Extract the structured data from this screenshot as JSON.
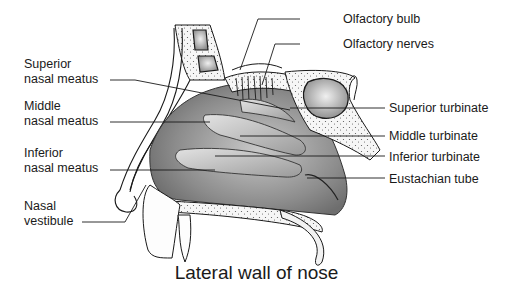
{
  "diagram": {
    "title": "Lateral wall of nose",
    "left_labels": [
      {
        "line1": "Superior",
        "line2": "nasal meatus"
      },
      {
        "line1": "Middle",
        "line2": "nasal meatus"
      },
      {
        "line1": "Inferior",
        "line2": "nasal meatus"
      },
      {
        "line1": "Nasal",
        "line2": "vestibule"
      }
    ],
    "right_labels": [
      "Olfactory bulb",
      "Olfactory nerves",
      "Superior turbinate",
      "Middle turbinate",
      "Inferior turbinate",
      "Eustachian tube"
    ],
    "colors": {
      "line": "#1a1a1a",
      "tissue_dark": "#8a8a8a",
      "tissue_light": "#d0d0d0",
      "bone": "#f4f4f4",
      "sinus": "#b8b8b8"
    }
  }
}
